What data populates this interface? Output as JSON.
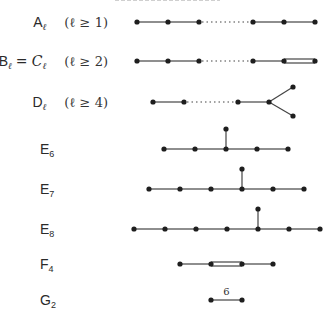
{
  "rows": [
    {
      "id": "A",
      "name": "A",
      "sub": "ℓ",
      "condition": "(ℓ ≥ 1)",
      "nodes": [
        [
          137,
          22
        ],
        [
          168,
          22
        ],
        [
          199,
          22
        ],
        [
          253,
          22
        ],
        [
          284,
          22
        ],
        [
          315,
          22
        ]
      ],
      "edges": [
        {
          "from": 0,
          "to": 1,
          "type": "single"
        },
        {
          "from": 1,
          "to": 2,
          "type": "single"
        },
        {
          "from": 2,
          "to": 3,
          "type": "dotted"
        },
        {
          "from": 3,
          "to": 4,
          "type": "single"
        },
        {
          "from": 4,
          "to": 5,
          "type": "single"
        }
      ]
    },
    {
      "id": "BC",
      "name": "B",
      "sub": "ℓ",
      "equals": "= C",
      "equals_sub": "ℓ",
      "condition": "(ℓ ≥ 2)",
      "nodes": [
        [
          137,
          61
        ],
        [
          168,
          61
        ],
        [
          199,
          61
        ],
        [
          253,
          61
        ],
        [
          284,
          61
        ],
        [
          315,
          61
        ]
      ],
      "edges": [
        {
          "from": 0,
          "to": 1,
          "type": "single"
        },
        {
          "from": 1,
          "to": 2,
          "type": "single"
        },
        {
          "from": 2,
          "to": 3,
          "type": "dotted"
        },
        {
          "from": 3,
          "to": 4,
          "type": "single"
        },
        {
          "from": 4,
          "to": 5,
          "type": "double"
        }
      ]
    },
    {
      "id": "D",
      "name": "D",
      "sub": "ℓ",
      "condition": "(ℓ ≥ 4)",
      "nodes": [
        [
          153,
          102
        ],
        [
          184,
          102
        ],
        [
          238,
          102
        ],
        [
          269,
          102
        ],
        [
          293,
          87
        ],
        [
          293,
          116
        ]
      ],
      "edges": [
        {
          "from": 0,
          "to": 1,
          "type": "single"
        },
        {
          "from": 1,
          "to": 2,
          "type": "dotted"
        },
        {
          "from": 2,
          "to": 3,
          "type": "single"
        },
        {
          "from": 3,
          "to": 4,
          "type": "single"
        },
        {
          "from": 3,
          "to": 5,
          "type": "single"
        }
      ]
    },
    {
      "id": "E6",
      "name": "E",
      "sub": "6",
      "nodes": [
        [
          164,
          149
        ],
        [
          195,
          149
        ],
        [
          226,
          149
        ],
        [
          257,
          149
        ],
        [
          288,
          149
        ],
        [
          226,
          129
        ]
      ],
      "edges": [
        {
          "from": 0,
          "to": 1,
          "type": "single"
        },
        {
          "from": 1,
          "to": 2,
          "type": "single"
        },
        {
          "from": 2,
          "to": 3,
          "type": "single"
        },
        {
          "from": 3,
          "to": 4,
          "type": "single"
        },
        {
          "from": 2,
          "to": 5,
          "type": "single"
        }
      ]
    },
    {
      "id": "E7",
      "name": "E",
      "sub": "7",
      "nodes": [
        [
          149,
          189
        ],
        [
          180,
          189
        ],
        [
          211,
          189
        ],
        [
          242,
          189
        ],
        [
          273,
          189
        ],
        [
          304,
          189
        ],
        [
          242,
          169
        ]
      ],
      "edges": [
        {
          "from": 0,
          "to": 1,
          "type": "single"
        },
        {
          "from": 1,
          "to": 2,
          "type": "single"
        },
        {
          "from": 2,
          "to": 3,
          "type": "single"
        },
        {
          "from": 3,
          "to": 4,
          "type": "single"
        },
        {
          "from": 4,
          "to": 5,
          "type": "single"
        },
        {
          "from": 3,
          "to": 6,
          "type": "single"
        }
      ]
    },
    {
      "id": "E8",
      "name": "E",
      "sub": "8",
      "nodes": [
        [
          134,
          229
        ],
        [
          165,
          229
        ],
        [
          196,
          229
        ],
        [
          227,
          229
        ],
        [
          258,
          229
        ],
        [
          289,
          229
        ],
        [
          320,
          229
        ],
        [
          258,
          209
        ]
      ],
      "edges": [
        {
          "from": 0,
          "to": 1,
          "type": "single"
        },
        {
          "from": 1,
          "to": 2,
          "type": "single"
        },
        {
          "from": 2,
          "to": 3,
          "type": "single"
        },
        {
          "from": 3,
          "to": 4,
          "type": "single"
        },
        {
          "from": 4,
          "to": 5,
          "type": "single"
        },
        {
          "from": 5,
          "to": 6,
          "type": "single"
        },
        {
          "from": 4,
          "to": 7,
          "type": "single"
        }
      ]
    },
    {
      "id": "F4",
      "name": "F",
      "sub": "4",
      "nodes": [
        [
          180,
          264
        ],
        [
          211,
          264
        ],
        [
          242,
          264
        ],
        [
          273,
          264
        ]
      ],
      "edges": [
        {
          "from": 0,
          "to": 1,
          "type": "single"
        },
        {
          "from": 1,
          "to": 2,
          "type": "double"
        },
        {
          "from": 2,
          "to": 3,
          "type": "single"
        }
      ]
    },
    {
      "id": "G2",
      "name": "G",
      "sub": "2",
      "nodes": [
        [
          211,
          300
        ],
        [
          242,
          300
        ]
      ],
      "edges": [
        {
          "from": 0,
          "to": 1,
          "type": "single",
          "label": "6"
        }
      ]
    }
  ],
  "labels": {
    "A": {
      "name": "A",
      "sub": "ℓ",
      "condition": "(ℓ ≥ 1)"
    },
    "BC": {
      "name": "B",
      "sub": "ℓ",
      "equals": "= C",
      "equals_sub": "ℓ",
      "condition": "(ℓ ≥ 2)"
    },
    "D": {
      "name": "D",
      "sub": "ℓ",
      "condition": "(ℓ ≥ 4)"
    },
    "E6": {
      "name": "E",
      "sub": "6"
    },
    "E7": {
      "name": "E",
      "sub": "7"
    },
    "E8": {
      "name": "E",
      "sub": "8"
    },
    "F4": {
      "name": "F",
      "sub": "4"
    },
    "G2": {
      "name": "G",
      "sub": "2",
      "edge_label": "6"
    }
  },
  "colors": {
    "node": "#1e1e1e",
    "edge": "#444444",
    "text": "#2a2a2a",
    "background": "#ffffff"
  }
}
